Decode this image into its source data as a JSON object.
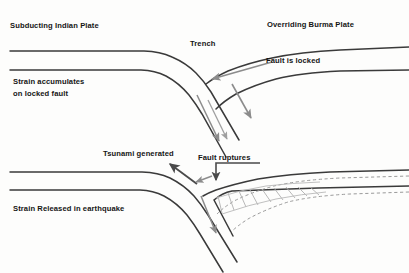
{
  "figure": {
    "colors": {
      "plate_line": "#3a3a3a",
      "arrow_gray": "#8c8c8c",
      "arrow_dark": "#4a4a4a",
      "dashed_line": "#9a9a9a",
      "hatch": "#b0b0b0",
      "text": "#151515",
      "background": "#fdfdfc"
    }
  },
  "upper_panel": {
    "name": "locked-fault-stage",
    "labels": {
      "subducting_plate": "Subducting Indian Plate",
      "overriding_plate": "Overriding Burma Plate",
      "trench": "Trench",
      "fault_locked": "Fault is locked",
      "strain_line1": "Strain accumulates",
      "strain_line2": "on locked fault"
    },
    "arrows": [
      {
        "name": "convergence-arrow",
        "direction": "left-down",
        "color": "#8c8c8c"
      },
      {
        "name": "slab-descent-arrow",
        "direction": "down",
        "color": "#8c8c8c"
      },
      {
        "name": "slab-pull-arrow",
        "direction": "down-right",
        "color": "#8c8c8c"
      },
      {
        "name": "slab-inner-arrow",
        "direction": "down",
        "color": "#9a9a9a"
      }
    ]
  },
  "lower_panel": {
    "name": "rupture-stage",
    "labels": {
      "tsunami": "Tsunami generated",
      "fault_ruptures": "Fault ruptures",
      "strain_released": "Strain Released in earthquake"
    },
    "arrows": [
      {
        "name": "tsunami-arrow",
        "direction": "up-left",
        "color": "#4a4a4a"
      },
      {
        "name": "fault-rupture-arrow",
        "direction": "down",
        "color": "#4a4a4a"
      },
      {
        "name": "rebound-arrow",
        "direction": "down-left",
        "color": "#8c8c8c"
      },
      {
        "name": "slab-descent-arrow-lower",
        "direction": "down",
        "color": "#8c8c8c"
      }
    ],
    "annotations": {
      "dashed_prior_position": "pre-earthquake plate position (dashed)",
      "hatched_uplift": "uplifted / rebounded wedge (hatched)"
    }
  }
}
